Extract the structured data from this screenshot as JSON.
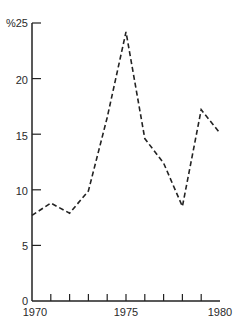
{
  "chart_data": {
    "type": "line",
    "title": "",
    "xlabel": "",
    "ylabel": "%",
    "x": [
      1970,
      1971,
      1972,
      1973,
      1974,
      1975,
      1976,
      1977,
      1978,
      1979,
      1980
    ],
    "series": [
      {
        "name": "rate",
        "values": [
          7.7,
          8.8,
          7.9,
          9.9,
          16.5,
          24.2,
          14.6,
          12.4,
          8.5,
          17.2,
          15.1
        ],
        "style": "dashed",
        "color": "#222222"
      }
    ],
    "xlim": [
      1970,
      1980
    ],
    "ylim": [
      0,
      25
    ],
    "x_tick_labels": [
      "1970",
      "1975",
      "1980"
    ],
    "y_tick_labels": [
      "0",
      "5",
      "10",
      "15",
      "20",
      "%25"
    ],
    "y_ticks": [
      0,
      5,
      10,
      15,
      20,
      25
    ],
    "grid": false,
    "legend": "none"
  },
  "axes": {
    "y_labels": [
      "0",
      "5",
      "10",
      "15",
      "20",
      "%25"
    ],
    "x_labels": [
      "1970",
      "1975",
      "1980"
    ]
  }
}
